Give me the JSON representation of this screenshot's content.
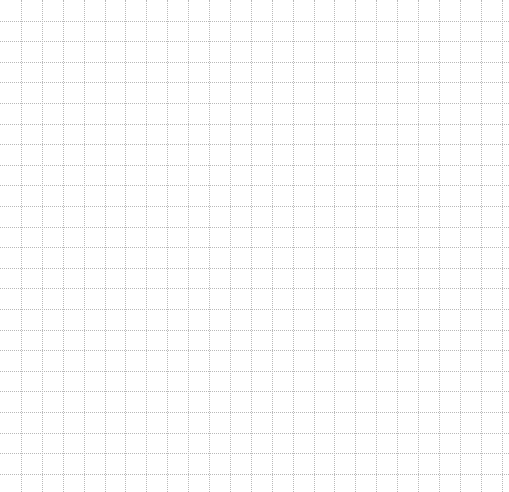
{
  "grid": {
    "width": 509,
    "height": 492,
    "cell_width": 20.9,
    "cell_height": 20.6,
    "line_style": "dotted",
    "line_color": "#b9b9b9",
    "background_color": "#ffffff",
    "columns": 24,
    "rows": 24
  }
}
